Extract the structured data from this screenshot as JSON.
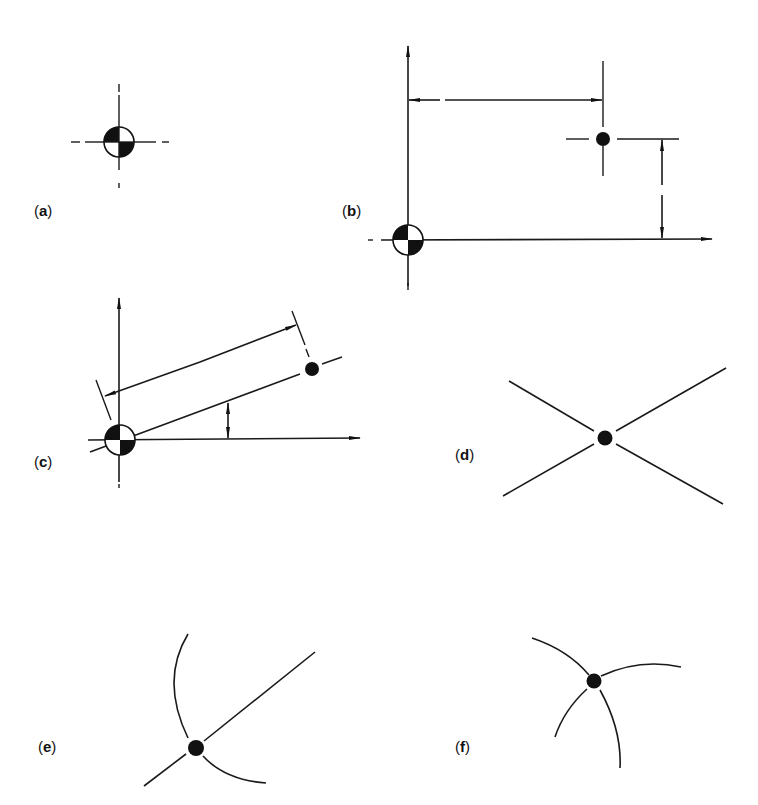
{
  "figure": {
    "panels": [
      {
        "id": "a",
        "label_open": "(",
        "label_letter": "a",
        "label_close": ")",
        "description": "Centroid symbol with dashed center lines"
      },
      {
        "id": "b",
        "label_open": "(",
        "label_letter": "b",
        "label_close": ")",
        "description": "Point located by rectangular coordinates from datum centroid"
      },
      {
        "id": "c",
        "label_open": "(",
        "label_letter": "c",
        "label_close": ")",
        "description": "Point located by polar coordinates (distance and angle) from datum centroid"
      },
      {
        "id": "d",
        "label_open": "(",
        "label_letter": "d",
        "label_close": ")",
        "description": "Point at intersection of two straight lines"
      },
      {
        "id": "e",
        "label_open": "(",
        "label_letter": "e",
        "label_close": ")",
        "description": "Point at intersection of a straight line and an arc"
      },
      {
        "id": "f",
        "label_open": "(",
        "label_letter": "f",
        "label_close": ")",
        "description": "Point at intersection of two arcs"
      }
    ],
    "colors": {
      "ink": "#111111",
      "background": "#ffffff"
    }
  }
}
